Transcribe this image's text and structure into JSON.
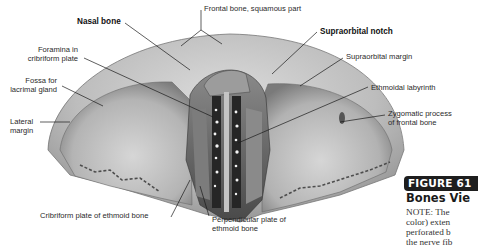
{
  "figure": {
    "badge": "FIGURE 61",
    "title": "Bones Vie",
    "note_lines": [
      "NOTE:  The",
      "color) exten",
      "perforated b",
      "the nerve fib"
    ]
  },
  "labels": {
    "frontal_bone": "Frontal bone, squamous part",
    "nasal_bone": "Nasal bone",
    "supraorbital_notch": "Supraorbital notch",
    "foramina_line1": "Foramina in",
    "foramina_line2": "cribriform plate",
    "supraorbital_margin": "Supraorbital margin",
    "fossa_line1": "Fossa for",
    "fossa_line2": "lacrimal gland",
    "ethmoidal_labyrinth": "Ethmoidal labyrinth",
    "lateral_line1": "Lateral",
    "lateral_line2": "margin",
    "zygomatic_line1": "Zygomatic process",
    "zygomatic_line2": "of frontal bone",
    "cribriform_plate": "Cribriform plate of ethmoid bone",
    "perpendicular_line1": "Perpendicular plate of",
    "perpendicular_line2": "ethmoid bone"
  },
  "colors": {
    "bone_light": "#cfcfcf",
    "bone_mid": "#a9a9a9",
    "bone_dark": "#5a5a5a",
    "leader": "#1a1a1a",
    "badge_bg": "#1e1e1e"
  }
}
